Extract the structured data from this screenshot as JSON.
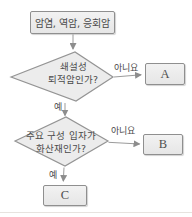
{
  "diagram": {
    "title_hint": "rock classification flowchart",
    "start_box": {
      "label": "암염, 역암, 응회암"
    },
    "decision1": {
      "line1": "쇄설성",
      "line2": "퇴적암인가?",
      "no_label": "아니요",
      "yes_label": "예"
    },
    "decision2": {
      "line1": "주요 구성 입자가",
      "line2": "화산재인가?",
      "no_label": "아니요",
      "yes_label": "예"
    },
    "result_a": {
      "label": "A"
    },
    "result_b": {
      "label": "B"
    },
    "result_c": {
      "label": "C"
    }
  },
  "colors": {
    "shape_fill": "#ececec",
    "shape_border": "#949494",
    "arrow_line": "#9b9b9b",
    "arrow_head": "#8d8d8d",
    "text": "#4a4a4a",
    "background": "#ffffff",
    "bottom_rule": "#e7e3df"
  }
}
